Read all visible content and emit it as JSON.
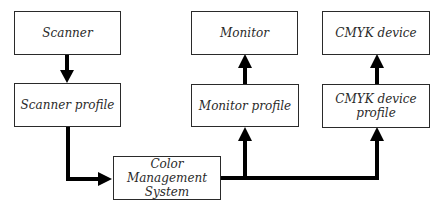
{
  "diagram": {
    "title": "",
    "nodes": [
      {
        "id": "scanner",
        "label": "Scanner"
      },
      {
        "id": "scanner_profile",
        "label": "Scanner profile"
      },
      {
        "id": "cms",
        "label": "Color\nManagement\nSystem"
      },
      {
        "id": "monitor",
        "label": "Monitor"
      },
      {
        "id": "monitor_profile",
        "label": "Monitor profile"
      },
      {
        "id": "cmyk_device",
        "label": "CMYK device"
      },
      {
        "id": "cmyk_profile",
        "label": "CMYK device\nprofile"
      }
    ],
    "edges": [
      {
        "from": "scanner",
        "to": "scanner_profile"
      },
      {
        "from": "scanner_profile",
        "to": "cms"
      },
      {
        "from": "cms",
        "to": "monitor_profile"
      },
      {
        "from": "cms",
        "to": "cmyk_profile"
      },
      {
        "from": "monitor_profile",
        "to": "monitor"
      },
      {
        "from": "cmyk_profile",
        "to": "cmyk_device"
      }
    ],
    "colors": {
      "line": "#000000",
      "border": "#2a2a2a",
      "text": "#2a2a2a",
      "background": "#ffffff"
    }
  }
}
